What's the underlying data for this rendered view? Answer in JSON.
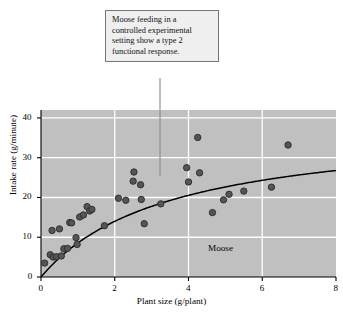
{
  "figure": {
    "callout": {
      "lines": [
        "Moose feeding in a",
        "controlled experimental",
        "setting show a type 2",
        "functional response."
      ],
      "leader_x": 160,
      "leader_y_top": 78,
      "leader_y_bottom": 176
    },
    "inline_label": "Moose",
    "colors": {
      "plot_background": "#c0c0c0",
      "gridline": "#ffffff",
      "point_fill": "#555555",
      "point_stroke": "#2a2a2a",
      "curve": "#000000",
      "axis": "#000000",
      "callout_background": "#efefef",
      "callout_border": "#777777"
    }
  },
  "chart_data": {
    "type": "scatter",
    "title": "",
    "xlabel": "Plant size (g/plant)",
    "ylabel": "Intake rate (g/minute)",
    "xlim": [
      0,
      8
    ],
    "ylim": [
      0,
      42
    ],
    "xticks": [
      0,
      2,
      4,
      6,
      8
    ],
    "yticks": [
      0,
      10,
      20,
      30,
      40
    ],
    "grid": true,
    "legend": "none",
    "annotations": [
      {
        "text": "Moose",
        "x": 4.9,
        "y": 6.5
      }
    ],
    "series": [
      {
        "name": "Moose intake observations",
        "type": "scatter",
        "points": [
          [
            0.1,
            3.5
          ],
          [
            0.25,
            5.6
          ],
          [
            0.3,
            11.7
          ],
          [
            0.33,
            5.0
          ],
          [
            0.42,
            5.1
          ],
          [
            0.5,
            12.1
          ],
          [
            0.55,
            5.3
          ],
          [
            0.62,
            7.1
          ],
          [
            0.72,
            7.2
          ],
          [
            0.78,
            13.7
          ],
          [
            0.83,
            13.6
          ],
          [
            0.95,
            9.9
          ],
          [
            0.98,
            8.2
          ],
          [
            1.05,
            15.1
          ],
          [
            1.15,
            15.6
          ],
          [
            1.25,
            17.7
          ],
          [
            1.32,
            16.6
          ],
          [
            1.38,
            17.0
          ],
          [
            1.72,
            12.9
          ],
          [
            2.1,
            19.8
          ],
          [
            2.3,
            19.3
          ],
          [
            2.5,
            24.1
          ],
          [
            2.52,
            26.4
          ],
          [
            2.7,
            23.2
          ],
          [
            2.72,
            19.5
          ],
          [
            2.8,
            13.4
          ],
          [
            3.25,
            18.4
          ],
          [
            3.95,
            27.5
          ],
          [
            4.0,
            23.9
          ],
          [
            4.25,
            35.1
          ],
          [
            4.3,
            26.2
          ],
          [
            4.65,
            16.2
          ],
          [
            4.95,
            19.4
          ],
          [
            5.1,
            20.8
          ],
          [
            5.5,
            21.6
          ],
          [
            6.25,
            22.6
          ],
          [
            6.7,
            33.2
          ]
        ]
      },
      {
        "name": "Type 2 functional response fit",
        "type": "line",
        "model": "holling-type-2",
        "equation_params": {
          "a": 38.5,
          "b": 3.5
        },
        "description": "y = a*x/(b+x) fitted curve rising steeply then saturating near 27 g/minute at x=8"
      }
    ]
  }
}
